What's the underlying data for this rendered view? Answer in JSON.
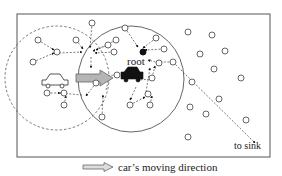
{
  "figure": {
    "labels": {
      "root": "root",
      "sink": "to sink"
    },
    "caption": {
      "text": "car’s moving direction",
      "icon": "hollow-right-arrow-icon"
    },
    "colors": {
      "line": "#444444",
      "frame": "#555555",
      "arrow_fill": "#b5b5b5",
      "node_stroke": "#555555",
      "car_filled": "#111111"
    },
    "elements": {
      "frame": "rectangular field boundary",
      "old_range": "dashed circle (car's previous range)",
      "new_range": "solid circle (car's current range)",
      "car_old": "outlined car icon",
      "car_new": "filled car icon at root",
      "movement_arrow": "gray block arrow",
      "sink_path": "dashed arrowed path to sink"
    }
  }
}
